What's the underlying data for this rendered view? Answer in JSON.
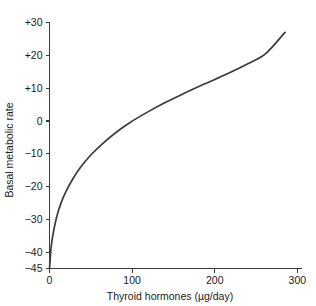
{
  "chart_data": {
    "type": "line",
    "title": "",
    "xlabel": "Thyroid hormones (µg/day)",
    "ylabel": "Basal metabolic rate",
    "xlim": [
      0,
      305
    ],
    "ylim": [
      -45,
      30
    ],
    "grid": false,
    "legend": null,
    "xticks": [
      0,
      100,
      200,
      300
    ],
    "xtick_labels": [
      "0",
      "100",
      "200",
      "300"
    ],
    "yticks": [
      30,
      20,
      10,
      0,
      -10,
      -20,
      -30,
      -40,
      -45
    ],
    "ytick_labels": [
      "+30",
      "+20",
      "+10",
      "0",
      "−10",
      "−20",
      "−30",
      "−40",
      "−45"
    ],
    "series": [
      {
        "name": "basal-metabolic-rate-response",
        "color": "#3b3b3b",
        "x": [
          0,
          2,
          5,
          9,
          14,
          20,
          28,
          38,
          50,
          64,
          80,
          98,
          118,
          140,
          163,
          188,
          214,
          240,
          262,
          285
        ],
        "y": [
          -45,
          -38.5,
          -33.5,
          -29.0,
          -25.0,
          -21.5,
          -17.8,
          -14.0,
          -10.4,
          -7.0,
          -3.6,
          -0.4,
          2.6,
          5.6,
          8.4,
          11.3,
          14.2,
          17.4,
          20.6,
          27.0
        ]
      }
    ]
  },
  "colors": {
    "curve": "#3b3b3b",
    "axis": "#3a3a3a",
    "text": "#1a1a1a",
    "background": "#ffffff"
  }
}
